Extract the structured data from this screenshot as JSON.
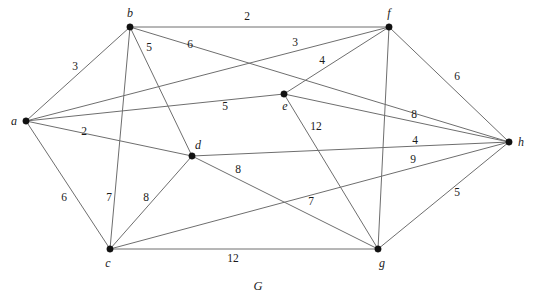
{
  "figure": {
    "caption": "G",
    "caption_x": 258,
    "caption_y": 286,
    "width": 533,
    "height": 303,
    "background_color": "#ffffff",
    "edge_color": "#6e6e6e",
    "vertex_color": "#111111",
    "text_color": "#1a1a1a"
  },
  "graph": {
    "type": "undirected-weighted-graph",
    "vertices": [
      {
        "id": "a",
        "label": "a",
        "x": 26,
        "y": 121,
        "label_x": 14,
        "label_y": 121
      },
      {
        "id": "b",
        "label": "b",
        "x": 130,
        "y": 27,
        "label_x": 130,
        "label_y": 13
      },
      {
        "id": "c",
        "label": "c",
        "x": 110,
        "y": 249,
        "label_x": 108,
        "label_y": 263
      },
      {
        "id": "d",
        "label": "d",
        "x": 192,
        "y": 156,
        "label_x": 198,
        "label_y": 145
      },
      {
        "id": "e",
        "label": "e",
        "x": 284,
        "y": 94,
        "label_x": 285,
        "label_y": 106
      },
      {
        "id": "f",
        "label": "f",
        "x": 389,
        "y": 27,
        "label_x": 389,
        "label_y": 13
      },
      {
        "id": "g",
        "label": "g",
        "x": 378,
        "y": 249,
        "label_x": 382,
        "label_y": 263
      },
      {
        "id": "h",
        "label": "h",
        "x": 509,
        "y": 142,
        "label_x": 521,
        "label_y": 142
      }
    ],
    "edges": [
      {
        "from": "a",
        "to": "b",
        "weight": 3,
        "label_x": 75,
        "label_y": 67
      },
      {
        "from": "a",
        "to": "c",
        "weight": 6,
        "label_x": 64,
        "label_y": 198
      },
      {
        "from": "a",
        "to": "d",
        "weight": 2,
        "label_x": 84,
        "label_y": 132
      },
      {
        "from": "a",
        "to": "e",
        "weight": 5,
        "label_x": 225,
        "label_y": 107
      },
      {
        "from": "a",
        "to": "f",
        "weight": 3,
        "label_x": 295,
        "label_y": 43
      },
      {
        "from": "b",
        "to": "f",
        "weight": 2,
        "label_x": 247,
        "label_y": 17
      },
      {
        "from": "b",
        "to": "c",
        "weight": 7,
        "label_x": 109,
        "label_y": 198
      },
      {
        "from": "b",
        "to": "d",
        "weight": 5,
        "label_x": 149,
        "label_y": 48
      },
      {
        "from": "b",
        "to": "h",
        "weight": 6,
        "label_x": 190,
        "label_y": 45
      },
      {
        "from": "c",
        "to": "d",
        "weight": 8,
        "label_x": 146,
        "label_y": 198
      },
      {
        "from": "c",
        "to": "g",
        "weight": 12,
        "label_x": 233,
        "label_y": 259
      },
      {
        "from": "c",
        "to": "h",
        "weight": 9,
        "label_x": 413,
        "label_y": 160
      },
      {
        "from": "d",
        "to": "g",
        "weight": 8,
        "label_x": 238,
        "label_y": 170
      },
      {
        "from": "d",
        "to": "h",
        "weight": 4,
        "label_x": 415,
        "label_y": 141
      },
      {
        "from": "e",
        "to": "f",
        "weight": 4,
        "label_x": 322,
        "label_y": 61
      },
      {
        "from": "e",
        "to": "g",
        "weight": 12,
        "label_x": 316,
        "label_y": 127
      },
      {
        "from": "e",
        "to": "h",
        "weight": 8,
        "label_x": 414,
        "label_y": 115
      },
      {
        "from": "f",
        "to": "h",
        "weight": 6,
        "label_x": 457,
        "label_y": 77
      },
      {
        "from": "f",
        "to": "g",
        "weight": 7,
        "label_x": 311,
        "label_y": 202
      },
      {
        "from": "g",
        "to": "h",
        "weight": 5,
        "label_x": 457,
        "label_y": 193
      }
    ]
  }
}
